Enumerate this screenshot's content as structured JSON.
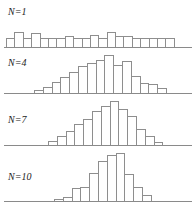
{
  "figure": {
    "title": "",
    "background_color": "#ffffff",
    "bar_outline_color": "#8e8e8e",
    "bar_fill_color": "#ffffff",
    "baseline_color": "#8a8a8a",
    "label_color": "#222222"
  },
  "panels": [
    {
      "label": "N=1",
      "label_n": "N",
      "label_eq": "=",
      "label_num": "1",
      "label_left": 8,
      "label_top": 7,
      "plot_top": 22,
      "plot_height": 26,
      "baseline_top": 25,
      "bars_left": 6,
      "bar_width": 9.4,
      "max_bar_height": 24
    },
    {
      "label": "N=4",
      "label_n": "N",
      "label_eq": "=",
      "label_num": "4",
      "label_left": 8,
      "label_top": 58,
      "plot_top": 52,
      "plot_height": 42,
      "baseline_top": 41,
      "bars_left": 34,
      "bar_width": 9.8,
      "max_bar_height": 40
    },
    {
      "label": "N=7",
      "label_n": "N",
      "label_eq": "=",
      "label_num": "7",
      "label_left": 8,
      "label_top": 115,
      "plot_top": 100,
      "plot_height": 46,
      "baseline_top": 45,
      "bars_left": 48,
      "bar_width": 9.8,
      "max_bar_height": 44
    },
    {
      "label": "N=10",
      "label_n": "N",
      "label_eq": "=",
      "label_num": "10",
      "label_left": 8,
      "label_top": 172,
      "plot_top": 152,
      "plot_height": 50,
      "baseline_top": 49,
      "bars_left": 54,
      "bar_width": 9.8,
      "max_bar_height": 48
    }
  ],
  "chart_data": {
    "type": "bar",
    "xlabel": "",
    "ylabel": "",
    "grid": false,
    "legend": false,
    "axis_note": "Each panel shares a common horizontal baseline; vertical axis is frequency (unlabeled).",
    "panels": [
      {
        "name": "N=1",
        "label": "N=1",
        "n": 1,
        "description": "Approximately uniform distribution with random sampling fluctuation across the full range.",
        "categories": [
          "1",
          "2",
          "3",
          "4",
          "5",
          "6",
          "7",
          "8",
          "9",
          "10",
          "11",
          "12",
          "13",
          "14",
          "15",
          "16",
          "17",
          "18",
          "19",
          "20"
        ],
        "values": [
          9,
          15,
          9,
          14,
          9,
          9,
          9,
          11,
          9,
          9,
          12,
          9,
          15,
          11,
          11,
          9,
          9,
          9,
          9,
          9
        ],
        "ylim": [
          0,
          24
        ]
      },
      {
        "name": "N=4",
        "label": "N=4",
        "n": 4,
        "description": "Broad bell-shaped distribution; means of 4 observations, clearly narrower than N=1.",
        "categories": [
          "1",
          "2",
          "3",
          "4",
          "5",
          "6",
          "7",
          "8",
          "9",
          "10",
          "11",
          "12",
          "13",
          "14",
          "15"
        ],
        "values": [
          3,
          6,
          11,
          16,
          21,
          27,
          30,
          33,
          38,
          28,
          32,
          17,
          10,
          9,
          5
        ],
        "ylim": [
          0,
          40
        ]
      },
      {
        "name": "N=7",
        "label": "N=7",
        "n": 7,
        "description": "Narrower, taller bell-shaped distribution; means of 7 observations.",
        "categories": [
          "1",
          "2",
          "3",
          "4",
          "5",
          "6",
          "7",
          "8",
          "9",
          "10",
          "11",
          "12",
          "13"
        ],
        "values": [
          4,
          9,
          14,
          21,
          26,
          34,
          39,
          44,
          36,
          29,
          16,
          9,
          3
        ],
        "ylim": [
          0,
          44
        ]
      },
      {
        "name": "N=10",
        "label": "N=10",
        "n": 10,
        "description": "Narrowest and tallest bell-shaped distribution; means of 10 observations, closest to normal.",
        "categories": [
          "1",
          "2",
          "3",
          "4",
          "5",
          "6",
          "7",
          "8",
          "9",
          "10",
          "11"
        ],
        "values": [
          2,
          4,
          13,
          14,
          28,
          40,
          46,
          48,
          27,
          14,
          6
        ],
        "ylim": [
          0,
          48
        ]
      }
    ]
  }
}
